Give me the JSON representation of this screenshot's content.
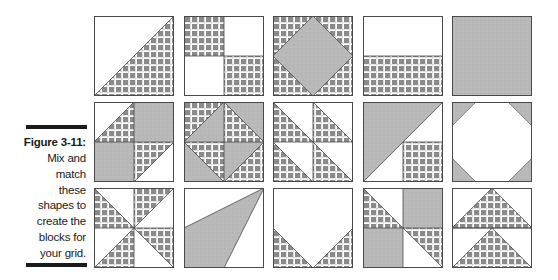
{
  "figure": {
    "label": "Figure 3-11:",
    "caption_lines": [
      "Mix and",
      "match",
      "these",
      "shapes to",
      "create the",
      "blocks for",
      "your grid."
    ]
  },
  "colors": {
    "plaid_square": "#8a8a8a",
    "plaid_line": "#ffffff",
    "stipple_gray": "#b9b9b9",
    "outline": "#4a4a4a",
    "caption_bar": "#1a1a1a",
    "background": "#ffffff"
  },
  "grid": {
    "rows": 3,
    "columns": 5,
    "blocks": [
      {
        "row": 1,
        "col": 1,
        "name": "half-square-triangle",
        "fills": [
          "white",
          "plaid"
        ]
      },
      {
        "row": 1,
        "col": 2,
        "name": "four-patch",
        "fills": [
          "plaid",
          "white",
          "white",
          "plaid"
        ]
      },
      {
        "row": 1,
        "col": 3,
        "name": "square-in-square",
        "fills": [
          "plaid",
          "stipple"
        ]
      },
      {
        "row": 1,
        "col": 4,
        "name": "two-bar-rectangle",
        "fills": [
          "white",
          "plaid"
        ]
      },
      {
        "row": 1,
        "col": 5,
        "name": "solid-square",
        "fills": [
          "stipple"
        ]
      },
      {
        "row": 2,
        "col": 1,
        "name": "half-square-pinwheel-variation",
        "fills": [
          "white",
          "plaid",
          "stipple",
          "stipple",
          "plaid",
          "white"
        ]
      },
      {
        "row": 2,
        "col": 2,
        "name": "diamond-quarters",
        "fills": [
          "plaid",
          "stipple",
          "plaid"
        ]
      },
      {
        "row": 2,
        "col": 3,
        "name": "four-half-square-triangles",
        "fills": [
          "plaid",
          "white"
        ]
      },
      {
        "row": 2,
        "col": 4,
        "name": "large-triangle-with-square",
        "fills": [
          "stipple",
          "white",
          "plaid"
        ]
      },
      {
        "row": 2,
        "col": 5,
        "name": "octagon-snowball",
        "fills": [
          "white",
          "stipple"
        ]
      },
      {
        "row": 3,
        "col": 1,
        "name": "pinwheel",
        "fills": [
          "plaid",
          "white"
        ]
      },
      {
        "row": 3,
        "col": 2,
        "name": "irregular-triangle",
        "fills": [
          "white",
          "stipple"
        ]
      },
      {
        "row": 3,
        "col": 3,
        "name": "pentagon-house",
        "fills": [
          "white",
          "plaid"
        ]
      },
      {
        "row": 3,
        "col": 4,
        "name": "two-triangle-four-patch",
        "fills": [
          "plaid",
          "stipple",
          "stipple",
          "plaid"
        ]
      },
      {
        "row": 3,
        "col": 5,
        "name": "flying-geese-pair",
        "fills": [
          "white",
          "plaid"
        ]
      }
    ]
  }
}
